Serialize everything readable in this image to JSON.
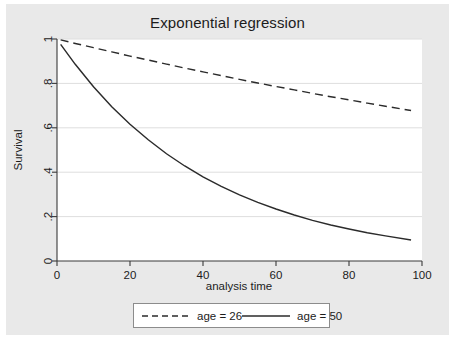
{
  "chart_data": {
    "type": "line",
    "title": "Exponential regression",
    "xlabel": "analysis time",
    "ylabel": "Survival",
    "xlim": [
      0,
      100
    ],
    "ylim": [
      0,
      1
    ],
    "xticks": [
      "0",
      "20",
      "40",
      "60",
      "80",
      "100"
    ],
    "xtick_values": [
      0,
      20,
      40,
      60,
      80,
      100
    ],
    "yticks": [
      "0",
      ".2",
      ".4",
      ".6",
      ".8",
      "1"
    ],
    "ytick_values": [
      0,
      0.2,
      0.4,
      0.6,
      0.8,
      1
    ],
    "grid": "horizontal",
    "legend_position": "bottom",
    "series": [
      {
        "name": "age = 26",
        "style": "dashed",
        "color": "#2b2b2b",
        "x": [
          1,
          5,
          10,
          15,
          20,
          25,
          30,
          35,
          40,
          45,
          50,
          55,
          60,
          65,
          70,
          75,
          80,
          85,
          90,
          97
        ],
        "values": [
          0.996,
          0.98,
          0.961,
          0.942,
          0.923,
          0.905,
          0.887,
          0.869,
          0.852,
          0.835,
          0.818,
          0.802,
          0.786,
          0.771,
          0.755,
          0.74,
          0.726,
          0.711,
          0.697,
          0.678
        ]
      },
      {
        "name": "age = 50",
        "style": "solid",
        "color": "#2b2b2b",
        "x": [
          1,
          5,
          10,
          15,
          20,
          25,
          30,
          35,
          40,
          45,
          50,
          55,
          60,
          65,
          70,
          75,
          80,
          85,
          90,
          97
        ],
        "values": [
          0.976,
          0.886,
          0.785,
          0.695,
          0.616,
          0.546,
          0.483,
          0.428,
          0.379,
          0.336,
          0.298,
          0.264,
          0.234,
          0.207,
          0.183,
          0.162,
          0.144,
          0.127,
          0.113,
          0.095
        ]
      }
    ]
  },
  "legend": {
    "entries": [
      {
        "label": "age = 26",
        "style": "dashed"
      },
      {
        "label": "age = 50",
        "style": "solid"
      }
    ]
  }
}
